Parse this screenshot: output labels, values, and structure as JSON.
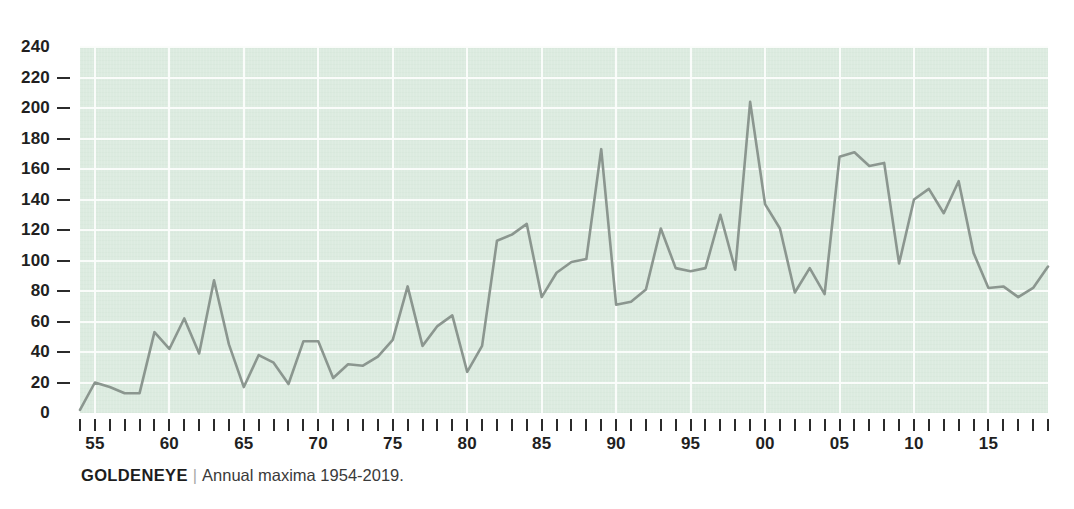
{
  "caption": {
    "title": "GOLDENEYE",
    "separator": "|",
    "text": "Annual maxima 1954-2019."
  },
  "colors": {
    "plot_background": "#dcebe0",
    "gridline": "#fbfdfb",
    "line": "#8b968f",
    "text": "#2b2b2b"
  },
  "chart_data": {
    "type": "line",
    "title": "GOLDENEYE",
    "subtitle": "Annual maxima 1954-2019.",
    "xlabel": "",
    "ylabel": "",
    "grid": true,
    "legend": null,
    "xlim": [
      1954,
      2019
    ],
    "ylim": [
      0,
      240
    ],
    "yticks": [
      0,
      20,
      40,
      60,
      80,
      100,
      120,
      140,
      160,
      180,
      200,
      220,
      240
    ],
    "ytick_labels": [
      "0",
      "20",
      "40",
      "60",
      "80",
      "100",
      "120",
      "140",
      "160",
      "180",
      "200",
      "220",
      "240"
    ],
    "xticks": [
      1955,
      1960,
      1965,
      1970,
      1975,
      1980,
      1985,
      1990,
      1995,
      2000,
      2005,
      2010,
      2015
    ],
    "xtick_labels": [
      "55",
      "60",
      "65",
      "70",
      "75",
      "80",
      "85",
      "90",
      "95",
      "00",
      "05",
      "10",
      "15"
    ],
    "xtick_minor_step": 1,
    "x": [
      1954,
      1955,
      1956,
      1957,
      1958,
      1959,
      1960,
      1961,
      1962,
      1963,
      1964,
      1965,
      1966,
      1967,
      1968,
      1969,
      1970,
      1971,
      1972,
      1973,
      1974,
      1975,
      1976,
      1977,
      1978,
      1979,
      1980,
      1981,
      1982,
      1983,
      1984,
      1985,
      1986,
      1987,
      1988,
      1989,
      1990,
      1991,
      1992,
      1993,
      1994,
      1995,
      1996,
      1997,
      1998,
      1999,
      2000,
      2001,
      2002,
      2003,
      2004,
      2005,
      2006,
      2007,
      2008,
      2009,
      2010,
      2011,
      2012,
      2013,
      2014,
      2015,
      2016,
      2017,
      2018,
      2019
    ],
    "series": [
      {
        "name": "Annual maxima",
        "color": "#8b968f",
        "values": [
          2,
          20,
          17,
          13,
          13,
          53,
          42,
          62,
          39,
          87,
          45,
          17,
          38,
          33,
          19,
          47,
          47,
          23,
          32,
          31,
          37,
          48,
          83,
          44,
          57,
          64,
          27,
          44,
          113,
          117,
          124,
          76,
          92,
          99,
          101,
          173,
          71,
          73,
          81,
          121,
          95,
          93,
          95,
          130,
          94,
          204,
          137,
          121,
          79,
          95,
          78,
          168,
          171,
          162,
          164,
          98,
          140,
          147,
          131,
          152,
          105,
          82,
          83,
          76,
          82,
          96
        ]
      }
    ]
  }
}
